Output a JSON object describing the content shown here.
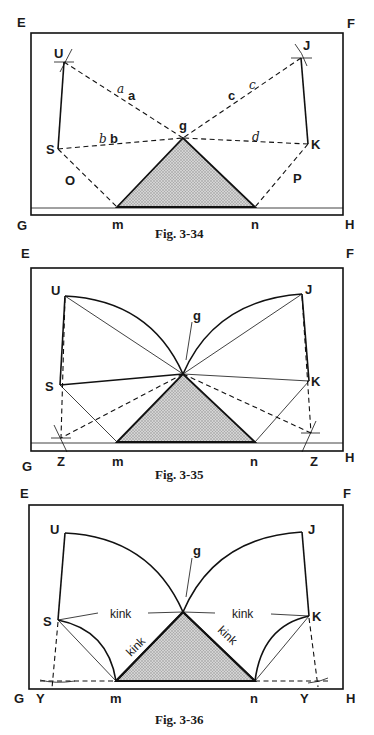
{
  "colors": {
    "ink": "#111111",
    "shade": "#c8c8c8",
    "background": "#ffffff"
  },
  "figures": [
    {
      "caption": "Fig. 3-34",
      "corners": {
        "E": "E",
        "F": "F",
        "G": "G",
        "H": "H"
      },
      "points": {
        "U": "U",
        "J": "J",
        "S": "S",
        "K": "K",
        "g": "g",
        "m": "m",
        "n": "n"
      },
      "segment_labels": {
        "a_hand": "a",
        "a": "a",
        "b_hand": "b",
        "b": "b",
        "c": "c",
        "c_hand": "c",
        "d_hand": "d",
        "O": "O",
        "P": "P"
      }
    },
    {
      "caption": "Fig. 3-35",
      "corners": {
        "E": "E",
        "F": "F",
        "G": "G",
        "H": "H"
      },
      "points": {
        "U": "U",
        "J": "J",
        "S": "S",
        "K": "K",
        "g": "g",
        "m": "m",
        "n": "n",
        "Z_left": "Z",
        "Z_right": "Z"
      }
    },
    {
      "caption": "Fig. 3-36",
      "corners": {
        "E": "E",
        "F": "F",
        "G": "G",
        "H": "H"
      },
      "points": {
        "U": "U",
        "J": "J",
        "S": "S",
        "K": "K",
        "g": "g",
        "m": "m",
        "n": "n",
        "Y_left": "Y",
        "Y_right": "Y"
      },
      "annotations": {
        "kink_left": "kink",
        "kink_right": "kink",
        "kink_left_diag": "kink",
        "kink_right_diag": "kink"
      }
    }
  ]
}
